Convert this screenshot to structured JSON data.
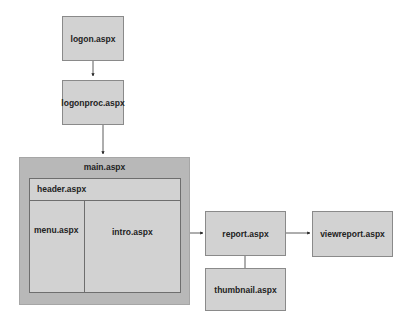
{
  "diagram": {
    "nodes": {
      "logon": {
        "label": "logon.aspx"
      },
      "logonproc": {
        "label": "logonproc.aspx"
      },
      "main": {
        "label": "main.aspx",
        "header": {
          "label": "header.aspx"
        },
        "menu": {
          "label": "menu.aspx"
        },
        "intro": {
          "label": "intro.aspx"
        }
      },
      "report": {
        "label": "report.aspx"
      },
      "viewreport": {
        "label": "viewreport.aspx"
      },
      "thumbnail": {
        "label": "thumbnail.aspx"
      }
    },
    "edges": [
      {
        "from": "logon.aspx",
        "to": "logonproc.aspx",
        "arrow": true
      },
      {
        "from": "logonproc.aspx",
        "to": "main.aspx",
        "arrow": true
      },
      {
        "from": "intro.aspx",
        "to": "report.aspx",
        "arrow": true
      },
      {
        "from": "report.aspx",
        "to": "viewreport.aspx",
        "arrow": true
      },
      {
        "from": "report.aspx",
        "to": "thumbnail.aspx",
        "arrow": false
      }
    ],
    "colors": {
      "node_fill": "#d2d2d2",
      "node_border": "#8a8a8a",
      "container_fill": "#b8b8b8",
      "line": "#333333"
    }
  }
}
